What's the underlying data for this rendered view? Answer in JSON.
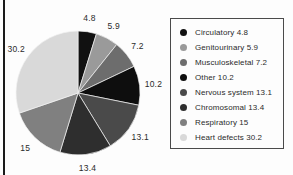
{
  "chart_data": {
    "type": "pie",
    "title": "",
    "xlabel": "",
    "ylabel": "",
    "legend_position": "right",
    "grid": false,
    "categories": [
      "Circulatory",
      "Genitourinary",
      "Musculoskeletal",
      "Other",
      "Nervous system",
      "Chromosomal",
      "Respiratory",
      "Heart defects"
    ],
    "values": [
      4.8,
      5.9,
      7.2,
      10.2,
      13.1,
      13.4,
      15,
      30.2
    ],
    "value_labels": [
      "4.8",
      "5.9",
      "7.2",
      "10.2",
      "13.1",
      "13.4",
      "15",
      "30.2"
    ],
    "colors": [
      "#111111",
      "#9a9a9a",
      "#6d6d6d",
      "#0e0e0e",
      "#4a4a4a",
      "#2e2e2e",
      "#808080",
      "#d9d9d9"
    ],
    "legend_entries": [
      "Circulatory 4.8",
      "Genitourinary 5.9",
      "Musculoskeletal 7.2",
      "Other 10.2",
      "Nervous system 13.1",
      "Chromosomal 13.4",
      "Respiratory 15",
      "Heart defects 30.2"
    ],
    "start_angle_deg": 0,
    "direction": "clockwise",
    "total": 99.8
  }
}
